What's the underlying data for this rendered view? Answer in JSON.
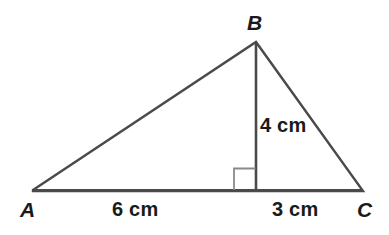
{
  "figure": {
    "type": "triangle-with-altitude",
    "background_color": "#ffffff",
    "stroke_color": "#4a4a4a",
    "right_angle_color": "#8a8a8a",
    "text_color": "#1a1a1a"
  },
  "vertices": {
    "a": {
      "label": "A",
      "x": 33,
      "y": 190
    },
    "b": {
      "label": "B",
      "x": 256,
      "y": 42
    },
    "c": {
      "label": "C",
      "x": 363,
      "y": 191
    }
  },
  "altitude": {
    "foot_x": 256,
    "foot_y": 190,
    "top_x": 256,
    "top_y": 42,
    "length_label": "4 cm"
  },
  "base_segments": [
    {
      "name": "left-segment",
      "label": "6 cm",
      "from": "A",
      "to": "foot"
    },
    {
      "name": "right-segment",
      "label": "3 cm",
      "from": "foot",
      "to": "C"
    }
  ],
  "right_angle_marker": {
    "x": 234,
    "y": 168,
    "size": 22,
    "side": "left"
  }
}
